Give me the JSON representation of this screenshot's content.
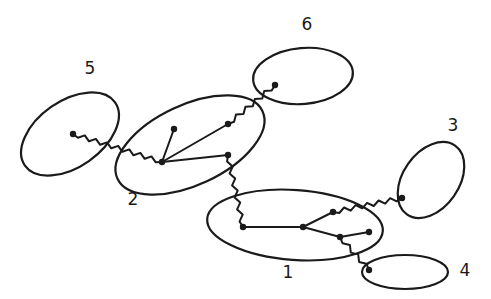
{
  "diagram": {
    "type": "cluster-tree",
    "clusters": [
      {
        "id": "1",
        "label": "1",
        "cx": 295,
        "cy": 225,
        "rx": 88,
        "ry": 35,
        "rotate": 4,
        "label_x": 288,
        "label_y": 272
      },
      {
        "id": "2",
        "label": "2",
        "cx": 190,
        "cy": 145,
        "rx": 80,
        "ry": 40,
        "rotate": -25,
        "label_x": 133,
        "label_y": 199
      },
      {
        "id": "3",
        "label": "3",
        "cx": 431,
        "cy": 180,
        "rx": 42,
        "ry": 28,
        "rotate": -55,
        "label_x": 453,
        "label_y": 125
      },
      {
        "id": "4",
        "label": "4",
        "cx": 405,
        "cy": 272,
        "rx": 43,
        "ry": 17,
        "rotate": 0,
        "label_x": 465,
        "label_y": 270
      },
      {
        "id": "5",
        "label": "5",
        "cx": 70,
        "cy": 134,
        "rx": 55,
        "ry": 33,
        "rotate": -35,
        "label_x": 90,
        "label_y": 68
      },
      {
        "id": "6",
        "label": "6",
        "cx": 303,
        "cy": 76,
        "rx": 50,
        "ry": 28,
        "rotate": -5,
        "label_x": 307,
        "label_y": 24
      }
    ],
    "nodes": [
      {
        "id": "n5a",
        "cluster": "5",
        "x": 73,
        "y": 134
      },
      {
        "id": "n2hub",
        "cluster": "2",
        "x": 162,
        "y": 162
      },
      {
        "id": "n2a",
        "cluster": "2",
        "x": 174,
        "y": 129
      },
      {
        "id": "n2b",
        "cluster": "2",
        "x": 228,
        "y": 124
      },
      {
        "id": "n2c",
        "cluster": "2",
        "x": 228,
        "y": 155
      },
      {
        "id": "n6a",
        "cluster": "6",
        "x": 275,
        "y": 85
      },
      {
        "id": "n1a",
        "cluster": "1",
        "x": 243,
        "y": 227
      },
      {
        "id": "n1hub",
        "cluster": "1",
        "x": 303,
        "y": 227
      },
      {
        "id": "n1b",
        "cluster": "1",
        "x": 333,
        "y": 212
      },
      {
        "id": "n1c",
        "cluster": "1",
        "x": 340,
        "y": 237
      },
      {
        "id": "n1d",
        "cluster": "1",
        "x": 369,
        "y": 232
      },
      {
        "id": "n3a",
        "cluster": "3",
        "x": 402,
        "y": 198
      },
      {
        "id": "n4a",
        "cluster": "4",
        "x": 369,
        "y": 270
      }
    ],
    "edges": [
      {
        "from": "n5a",
        "to": "n2hub",
        "style": "wavy"
      },
      {
        "from": "n2hub",
        "to": "n2a",
        "style": "straight"
      },
      {
        "from": "n2hub",
        "to": "n2b",
        "style": "straight"
      },
      {
        "from": "n2hub",
        "to": "n2c",
        "style": "straight"
      },
      {
        "from": "n2b",
        "to": "n6a",
        "style": "wavy"
      },
      {
        "from": "n2c",
        "to": "n1a",
        "style": "wavy"
      },
      {
        "from": "n1a",
        "to": "n1hub",
        "style": "straight"
      },
      {
        "from": "n1hub",
        "to": "n1b",
        "style": "straight"
      },
      {
        "from": "n1hub",
        "to": "n1c",
        "style": "straight"
      },
      {
        "from": "n1c",
        "to": "n1d",
        "style": "straight"
      },
      {
        "from": "n1b",
        "to": "n3a",
        "style": "wavy"
      },
      {
        "from": "n1c",
        "to": "n4a",
        "style": "wavy"
      }
    ],
    "stroke_color": "#1a1a1a",
    "background": "#ffffff"
  }
}
